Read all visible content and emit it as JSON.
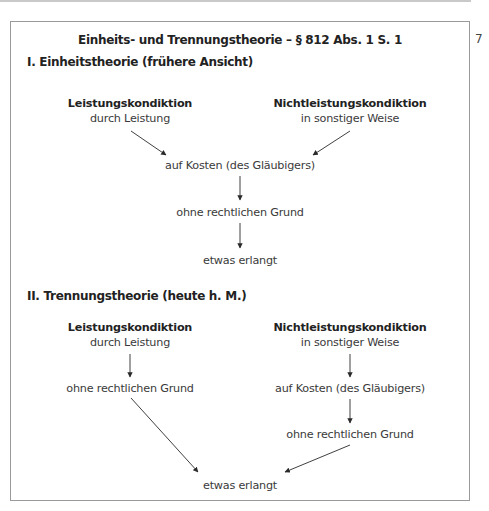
{
  "page": {
    "margin_number": "7"
  },
  "diagram": {
    "title": "Einheits- und Trennungstheorie – § 812 Abs. 1 S. 1",
    "section_1": {
      "heading": "I. Einheitstheorie (frühere Ansicht)",
      "left_node": {
        "title": "Leistungskondiktion",
        "subtitle": "durch Leistung"
      },
      "right_node": {
        "title": "Nichtleistungskondiktion",
        "subtitle": "in sonstiger Weise"
      },
      "merge_node": "auf Kosten (des Gläubigers)",
      "middle_node": "ohne rechtlichen Grund",
      "result_node": "etwas erlangt"
    },
    "section_2": {
      "heading": "II. Trennungstheorie (heute h. M.)",
      "left_branch": {
        "title": "Leistungskondiktion",
        "subtitle": "durch Leistung",
        "step_1": "ohne rechtlichen Grund"
      },
      "right_branch": {
        "title": "Nichtleistungskondiktion",
        "subtitle": "in sonstiger Weise",
        "step_1": "auf Kosten (des Gläubigers)",
        "step_2": "ohne rechtlichen Grund"
      },
      "result_node": "etwas erlangt"
    },
    "colors": {
      "text": "#3a3a3a",
      "heading": "#222222",
      "frame": "#9a9a9a",
      "arrow": "#2a2a2a"
    }
  }
}
